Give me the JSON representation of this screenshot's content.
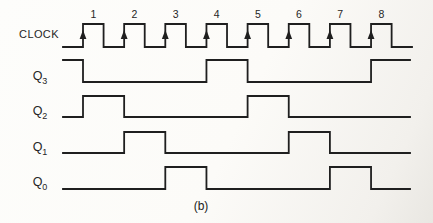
{
  "figure": {
    "caption": "(b)",
    "colors": {
      "line": "#1f1f1f",
      "text": "#262626",
      "background": "#fcfbf8"
    }
  },
  "clock": {
    "label": "CLOCK",
    "pulse_numbers": [
      "1",
      "2",
      "3",
      "4",
      "5",
      "6",
      "7",
      "8"
    ],
    "initial_level": 0,
    "rising_edge_arrows": true
  },
  "signals": [
    {
      "id": "Q3",
      "label": "Q",
      "sub": "3",
      "initial_level": 1,
      "toggle_edges": [
        1,
        4,
        5,
        8
      ]
    },
    {
      "id": "Q2",
      "label": "Q",
      "sub": "2",
      "initial_level": 0,
      "toggle_edges": [
        1,
        2,
        5,
        6
      ]
    },
    {
      "id": "Q1",
      "label": "Q",
      "sub": "1",
      "initial_level": 0,
      "toggle_edges": [
        2,
        3,
        6,
        7
      ]
    },
    {
      "id": "Q0",
      "label": "Q",
      "sub": "0",
      "initial_level": 0,
      "toggle_edges": [
        3,
        4,
        7,
        8
      ]
    }
  ]
}
